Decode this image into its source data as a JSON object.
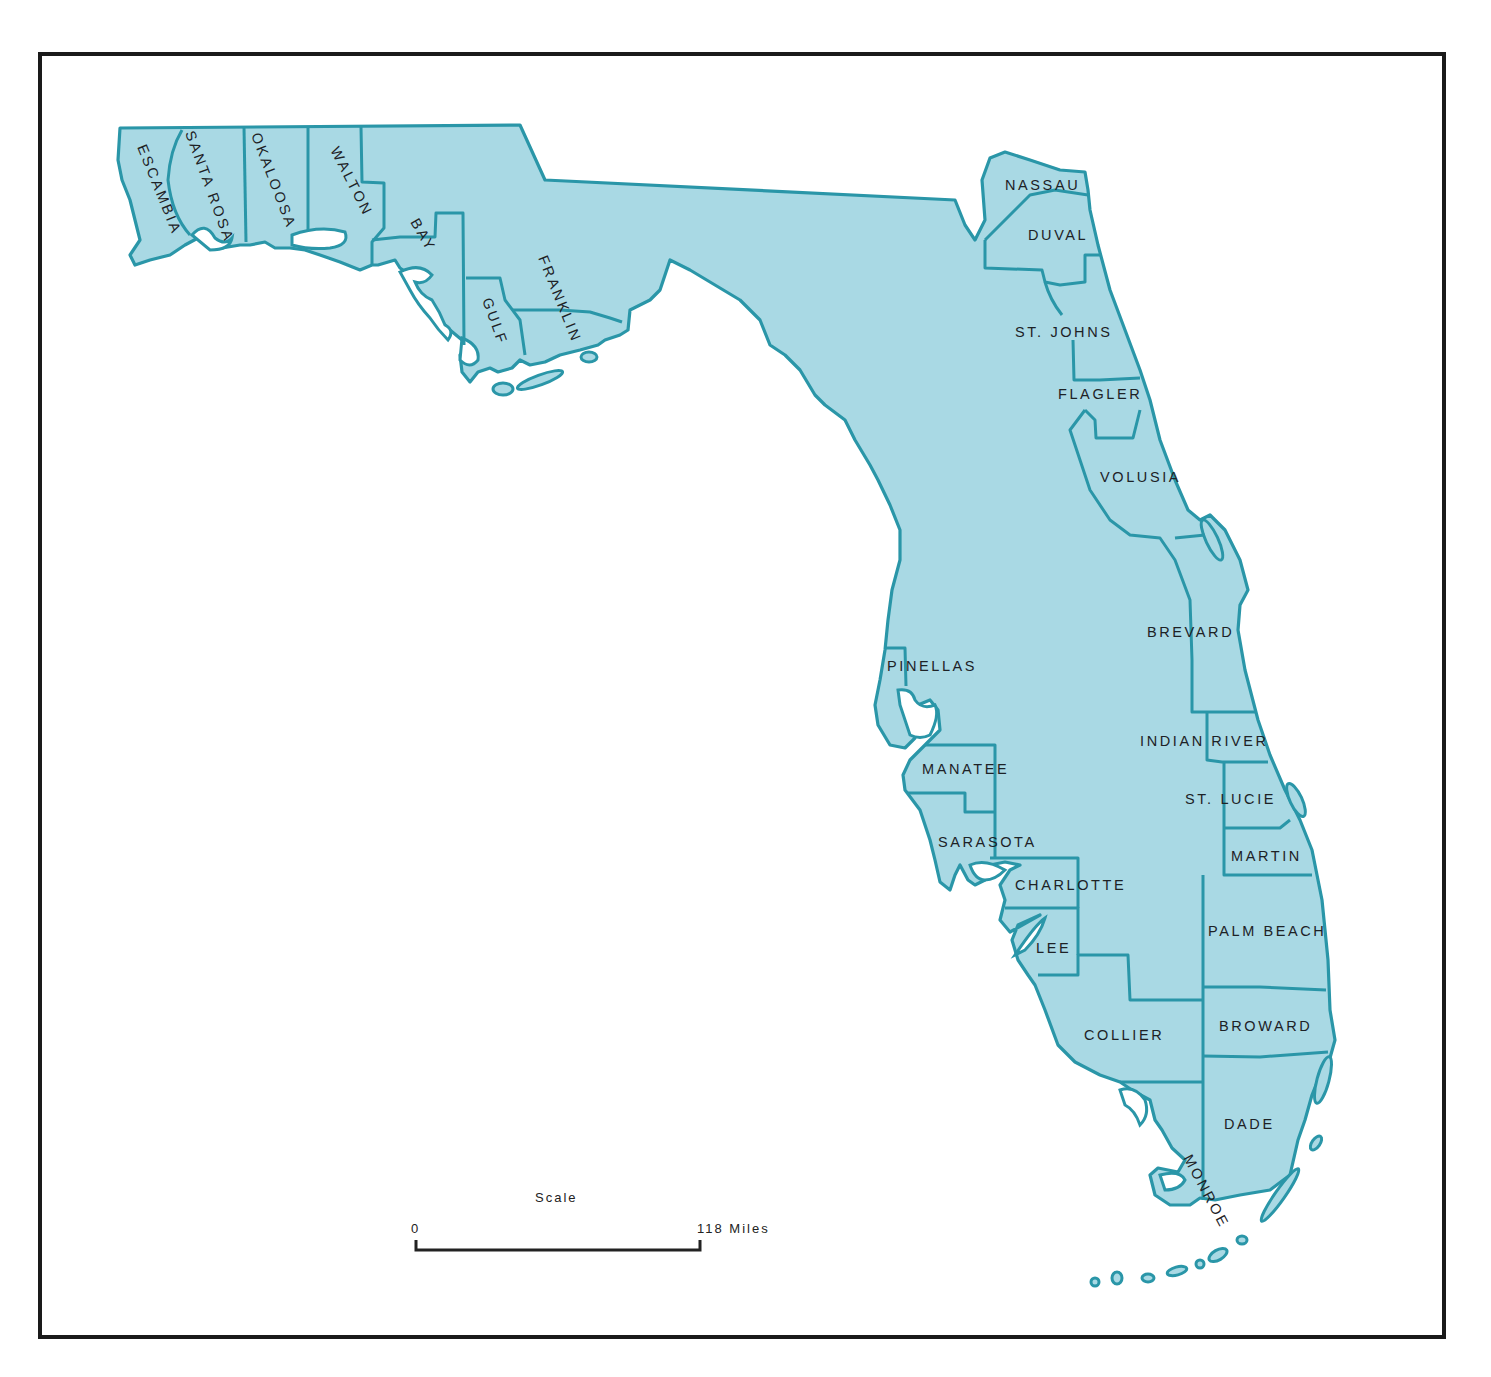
{
  "map": {
    "title": "Florida Counties",
    "colors": {
      "land": "#a9d9e4",
      "border": "#2a96a8",
      "frame": "#1a1a1a",
      "label": "#1d2226"
    },
    "counties": [
      {
        "name": "ESCAMBIA"
      },
      {
        "name": "SANTA ROSA"
      },
      {
        "name": "OKALOOSA"
      },
      {
        "name": "WALTON"
      },
      {
        "name": "BAY"
      },
      {
        "name": "GULF"
      },
      {
        "name": "FRANKLIN"
      },
      {
        "name": "NASSAU"
      },
      {
        "name": "DUVAL"
      },
      {
        "name": "ST. JOHNS"
      },
      {
        "name": "FLAGLER"
      },
      {
        "name": "VOLUSIA"
      },
      {
        "name": "BREVARD"
      },
      {
        "name": "INDIAN RIVER"
      },
      {
        "name": "ST. LUCIE"
      },
      {
        "name": "MARTIN"
      },
      {
        "name": "PALM BEACH"
      },
      {
        "name": "BROWARD"
      },
      {
        "name": "DADE"
      },
      {
        "name": "MONROE"
      },
      {
        "name": "COLLIER"
      },
      {
        "name": "LEE"
      },
      {
        "name": "CHARLOTTE"
      },
      {
        "name": "SARASOTA"
      },
      {
        "name": "MANATEE"
      },
      {
        "name": "PINELLAS"
      }
    ],
    "scale": {
      "title": "Scale",
      "start_label": "0",
      "end_label": "118 Miles"
    }
  }
}
